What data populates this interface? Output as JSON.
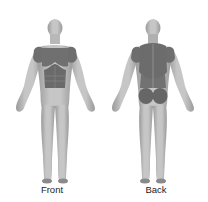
{
  "views": [
    {
      "id": "front",
      "label": "Front",
      "highlighted_regions": [
        "left-deltoid",
        "right-deltoid",
        "chest",
        "abdominals"
      ]
    },
    {
      "id": "back",
      "label": "Back",
      "highlighted_regions": [
        "left-deltoid",
        "right-deltoid",
        "upper-back",
        "lower-back",
        "left-glute",
        "right-glute"
      ]
    }
  ],
  "colors": {
    "body": "#bdbdbd",
    "body_shade": "#9a9a9a",
    "highlight": "#6e6e6e",
    "background": "#ffffff"
  }
}
